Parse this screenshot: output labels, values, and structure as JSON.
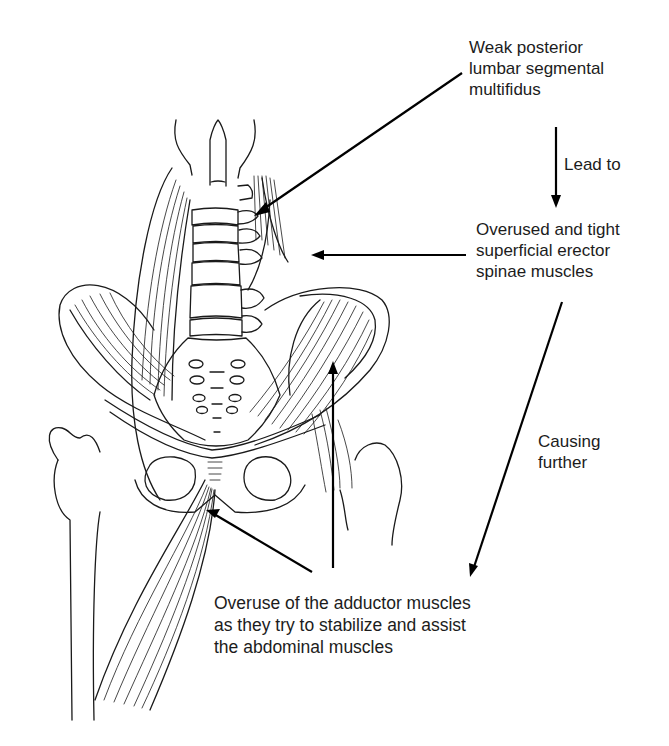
{
  "figure": {
    "ink_color": "#1a1a1a",
    "background": "#ffffff"
  },
  "annotations": {
    "weak_multifidus": {
      "lines": [
        "Weak posterior",
        "lumbar segmental",
        "multifidus"
      ]
    },
    "lead_to": {
      "lines": [
        "Lead to"
      ]
    },
    "erector_spinae": {
      "lines": [
        "Overused and tight",
        "superficial erector",
        "spinae muscles"
      ]
    },
    "causing_further": {
      "lines": [
        "Causing",
        "further"
      ]
    },
    "adductor_overuse": {
      "lines": [
        "Overuse of the adductor muscles",
        "as they try to stabilize and assist",
        "the abdominal muscles"
      ]
    }
  },
  "arrows": [
    {
      "from": "weak_multifidus",
      "to": "multifidus-in-drawing",
      "meaning": "points to"
    },
    {
      "from": "weak_multifidus",
      "to": "erector_spinae",
      "meaning": "lead to"
    },
    {
      "from": "erector_spinae",
      "to": "erector-spinae-in-drawing",
      "meaning": "points to"
    },
    {
      "from": "erector_spinae",
      "to": "adductor_overuse",
      "meaning": "causing further"
    },
    {
      "from": "adductor_overuse",
      "to": "adductor-in-drawing",
      "meaning": "points to"
    },
    {
      "from": "adductor_overuse",
      "to": "abdominal-iliacus-in-drawing",
      "meaning": "points to"
    }
  ]
}
